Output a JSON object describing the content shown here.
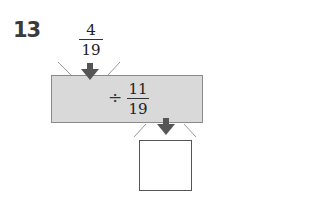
{
  "problem": {
    "number": "13",
    "input_fraction": {
      "numerator": "4",
      "denominator": "19"
    },
    "operation": {
      "symbol": "÷",
      "numerator": "11",
      "denominator": "19"
    },
    "answer": ""
  },
  "colors": {
    "box_fill": "#d9d9d9",
    "arrow": "#555555"
  },
  "icons": {
    "input_arrow": "arrow-down-icon",
    "output_arrow": "arrow-down-icon"
  }
}
